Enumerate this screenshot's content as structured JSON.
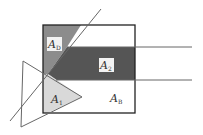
{
  "diagram": {
    "type": "geometric-area-diagram",
    "shapes": {
      "square": {
        "stroke": "#222222"
      },
      "region_d": {
        "fill": "#8c8c8c"
      },
      "region_band": {
        "fill": "#555555"
      },
      "region_1": {
        "fill": "#d9d9d9"
      },
      "lines": {
        "stroke": "#666666"
      }
    },
    "labels": [
      {
        "id": "A_D",
        "main": "A",
        "sub": "D"
      },
      {
        "id": "A_2",
        "main": "A",
        "sub": "2"
      },
      {
        "id": "A_1",
        "main": "A",
        "sub": "1"
      },
      {
        "id": "A_B",
        "main": "A",
        "sub": "B"
      }
    ]
  }
}
